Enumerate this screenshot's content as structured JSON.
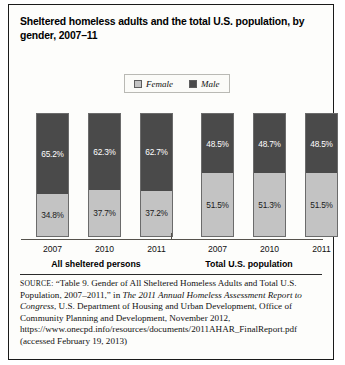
{
  "figure": {
    "title": "Sheltered homeless adults and the total U.S. population, by gender, 2007–11",
    "source_word": "SOURCE:",
    "source_part1": " “Table 9. Gender of All Sheltered Homeless Adults and Total U.S. Population, 2007–2011,” in ",
    "source_italic": "The 2011 Annual Homeless Assessment Report to Congress",
    "source_part2": ", U.S. Department of Housing and Urban Development, Office of Community Planning and Development, November 2012, https://www.onecpd.info/resources/documents/2011AHAR_FinalReport.pdf (accessed February 19, 2013)"
  },
  "legend": {
    "items": [
      {
        "label": "Female",
        "color": "#c3c3c3",
        "icon": "legend-swatch-female"
      },
      {
        "label": "Male",
        "color": "#4a4a4a",
        "icon": "legend-swatch-male"
      }
    ]
  },
  "chart_data": {
    "type": "bar",
    "title": "Sheltered homeless adults and the total U.S. population, by gender, 2007–11",
    "subtitle": "",
    "xlabel": "",
    "ylabel": "",
    "ylim": [
      0,
      100
    ],
    "stacked": true,
    "grid": false,
    "legend_position": "top-center",
    "value_suffix": "%",
    "groups": [
      {
        "name": "All sheltered persons",
        "categories": [
          "2007",
          "2010",
          "2011"
        ],
        "series": [
          {
            "name": "Female",
            "values": [
              34.8,
              37.7,
              37.2
            ]
          },
          {
            "name": "Male",
            "values": [
              65.2,
              62.3,
              62.7
            ]
          }
        ]
      },
      {
        "name": "Total U.S. population",
        "categories": [
          "2007",
          "2010",
          "2011"
        ],
        "series": [
          {
            "name": "Female",
            "values": [
              51.5,
              51.3,
              51.5
            ]
          },
          {
            "name": "Male",
            "values": [
              48.5,
              48.7,
              48.5
            ]
          }
        ]
      }
    ],
    "bars": [
      {
        "group": "All sheltered persons",
        "category": "2007",
        "male": "65.2%",
        "female": "34.8%",
        "male_pct": 65.2,
        "female_pct": 34.8
      },
      {
        "group": "All sheltered persons",
        "category": "2010",
        "male": "62.3%",
        "female": "37.7%",
        "male_pct": 62.3,
        "female_pct": 37.7
      },
      {
        "group": "All sheltered persons",
        "category": "2011",
        "male": "62.7%",
        "female": "37.2%",
        "male_pct": 62.7,
        "female_pct": 37.2
      },
      {
        "group": "Total U.S. population",
        "category": "2007",
        "male": "48.5%",
        "female": "51.5%",
        "male_pct": 48.5,
        "female_pct": 51.5
      },
      {
        "group": "Total U.S. population",
        "category": "2010",
        "male": "48.7%",
        "female": "51.3%",
        "male_pct": 48.7,
        "female_pct": 51.3
      },
      {
        "group": "Total U.S. population",
        "category": "2011",
        "male": "48.5%",
        "female": "51.5%",
        "male_pct": 48.5,
        "female_pct": 51.5
      }
    ],
    "colors": {
      "female": "#c3c3c3",
      "male": "#4a4a4a",
      "border": "#6b6b6b",
      "axis": "#55524c"
    }
  }
}
